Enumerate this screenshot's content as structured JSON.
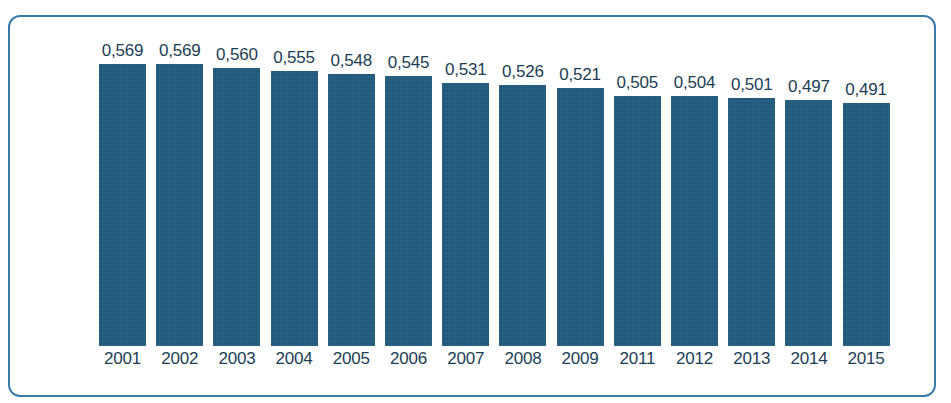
{
  "title_remnant": "",
  "colors": {
    "bar_fill": "#1d5a7d",
    "frame_border": "#3a7ca8",
    "label_text": "#1b3e55",
    "background": "#ffffff"
  },
  "chart_data": {
    "type": "bar",
    "title": "",
    "xlabel": "",
    "ylabel": "",
    "grid": false,
    "legend": false,
    "ylim": [
      0,
      0.62
    ],
    "decimal_separator": ",",
    "categories": [
      "2001",
      "2002",
      "2003",
      "2004",
      "2005",
      "2006",
      "2007",
      "2008",
      "2009",
      "2011",
      "2012",
      "2013",
      "2014",
      "2015"
    ],
    "values": [
      0.569,
      0.569,
      0.56,
      0.555,
      0.548,
      0.545,
      0.531,
      0.526,
      0.521,
      0.505,
      0.504,
      0.501,
      0.497,
      0.491
    ],
    "value_labels": [
      "0,569",
      "0,569",
      "0,560",
      "0,555",
      "0,548",
      "0,545",
      "0,531",
      "0,526",
      "0,521",
      "0,505",
      "0,504",
      "0,501",
      "0,497",
      "0,491"
    ]
  }
}
